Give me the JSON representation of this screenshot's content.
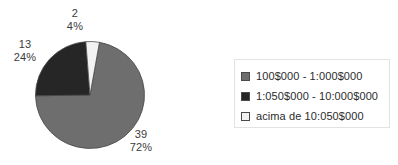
{
  "chart_data": {
    "type": "pie",
    "title": "",
    "xlabel": "",
    "ylabel": "",
    "legend_position": "right",
    "grid": false,
    "total": 54,
    "categories": [
      "100$000 - 1:000$000",
      "1:050$000 - 10:000$000",
      "acima de 10:050$000"
    ],
    "values": [
      39,
      13,
      2
    ],
    "percentages": [
      72,
      24,
      4
    ],
    "colors": [
      "#6e6e6e",
      "#262626",
      "#f2f2f2"
    ],
    "slices": [
      {
        "label": "100$000 - 1:000$000",
        "value": "39",
        "percent": "72%",
        "value_number": 39,
        "percent_number": 72,
        "color": "#6e6e6e",
        "swatch_name": "legend-swatch-gray"
      },
      {
        "label": "1:050$000 - 10:000$000",
        "value": "13",
        "percent": "24%",
        "value_number": 13,
        "percent_number": 24,
        "color": "#262626",
        "swatch_name": "legend-swatch-black"
      },
      {
        "label": "acima de 10:050$000",
        "value": "2",
        "percent": "4%",
        "value_number": 2,
        "percent_number": 4,
        "color": "#f2f2f2",
        "swatch_name": "legend-swatch-white"
      }
    ]
  },
  "legend": {
    "items": [
      {
        "label": "100$000 - 1:000$000",
        "color": "#6e6e6e"
      },
      {
        "label": "1:050$000 - 10:000$000",
        "color": "#262626"
      },
      {
        "label": "acima de 10:050$000",
        "color": "#f2f2f2"
      }
    ]
  },
  "labels": {
    "slice0_value": "39",
    "slice0_percent": "72%",
    "slice1_value": "13",
    "slice1_percent": "24%",
    "slice2_value": "2",
    "slice2_percent": "4%"
  },
  "colors": {
    "slice_gray": "#6e6e6e",
    "slice_black": "#262626",
    "slice_white": "#f2f2f2",
    "outline": "#4a4a4a",
    "text": "#2b2b2b",
    "legend_border": "#e2e2e2"
  }
}
